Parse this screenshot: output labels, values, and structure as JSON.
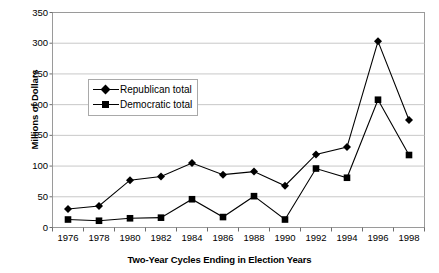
{
  "chart_data": {
    "type": "line",
    "title": "",
    "xlabel": "Two-Year Cycles Ending in Election Years",
    "ylabel": "Millions of Dollars",
    "categories": [
      "1976",
      "1978",
      "1980",
      "1982",
      "1984",
      "1986",
      "1988",
      "1990",
      "1992",
      "1994",
      "1996",
      "1998"
    ],
    "series": [
      {
        "name": "Republican total",
        "marker": "diamond",
        "color": "#000000",
        "values": [
          30,
          35,
          77,
          83,
          105,
          86,
          91,
          68,
          119,
          131,
          303,
          175
        ]
      },
      {
        "name": "Democratic total",
        "marker": "square",
        "color": "#000000",
        "values": [
          13,
          11,
          15,
          16,
          46,
          17,
          51,
          13,
          96,
          81,
          208,
          118
        ]
      }
    ],
    "ylim": [
      0,
      350
    ],
    "ytick_labels": [
      "0",
      "50",
      "100",
      "150",
      "200",
      "250",
      "300",
      "350"
    ],
    "ytick_values": [
      0,
      50,
      100,
      150,
      200,
      250,
      300,
      350
    ],
    "grid": "horizontal",
    "legend_position": "inside-upper-left"
  },
  "legend": {
    "entries": [
      {
        "label": "Republican total"
      },
      {
        "label": "Democratic total"
      }
    ]
  }
}
